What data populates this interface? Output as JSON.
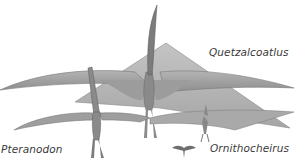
{
  "figure": {
    "type": "pterosaur size comparison illustration",
    "top_title_partially_cut": "",
    "labels": {
      "quetzalcoatlus": "Quetzalcoatlus",
      "ornithocheirus": "Ornithocheirus",
      "pteranodon": "Pteranodon"
    },
    "colors": {
      "background": "#ffffff",
      "wing_dark": "#8c8c8c",
      "wing_mid": "#a8a8a8",
      "wing_light": "#bdbdbd",
      "outline": "#6e6e6e",
      "label_text": "#3a3a3a"
    }
  }
}
